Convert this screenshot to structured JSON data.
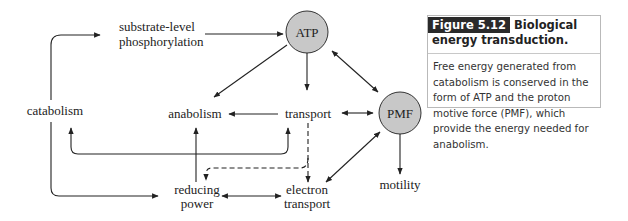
{
  "diagram": {
    "nodes": {
      "atp": "ATP",
      "pmf": "PMF",
      "catabolism": "catabolism",
      "substrate_line1": "substrate-level",
      "substrate_line2": "phosphorylation",
      "anabolism": "anabolism",
      "transport": "transport",
      "reducing_line1": "reducing",
      "reducing_line2": "power",
      "electron_line1": "electron",
      "electron_line2": "transport",
      "motility": "motility"
    },
    "colors": {
      "circle_fill": "#c8c8c8",
      "line": "#222222"
    }
  },
  "caption": {
    "figure_label": "Figure 5.12",
    "title": "Biological energy transduction.",
    "body": "Free energy generated from catabolism is conserved in the form of ATP and the proton motive force (PMF), which provide the energy needed for anabolism."
  }
}
